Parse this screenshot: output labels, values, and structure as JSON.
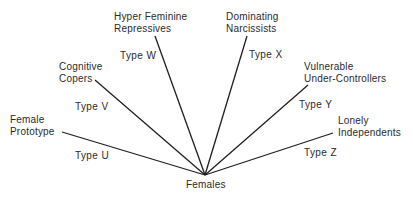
{
  "root": {
    "label": "Females"
  },
  "branches": [
    {
      "id": "U",
      "type_label": "Type U",
      "name_lines": [
        "Female",
        "Prototype"
      ]
    },
    {
      "id": "V",
      "type_label": "Type V",
      "name_lines": [
        "Cognitive",
        "Copers"
      ]
    },
    {
      "id": "W",
      "type_label": "Type W",
      "name_lines": [
        "Hyper Feminine",
        "Repressives"
      ]
    },
    {
      "id": "X",
      "type_label": "Type X",
      "name_lines": [
        "Dominating",
        "Narcissists"
      ]
    },
    {
      "id": "Y",
      "type_label": "Type Y",
      "name_lines": [
        "Vulnerable",
        "Under-Controllers"
      ]
    },
    {
      "id": "Z",
      "type_label": "Type Z",
      "name_lines": [
        "Lonely",
        "Independents"
      ]
    }
  ],
  "colors": {
    "line": "#1f1f1f",
    "text": "#2a2a2a",
    "background": "#ffffff"
  }
}
